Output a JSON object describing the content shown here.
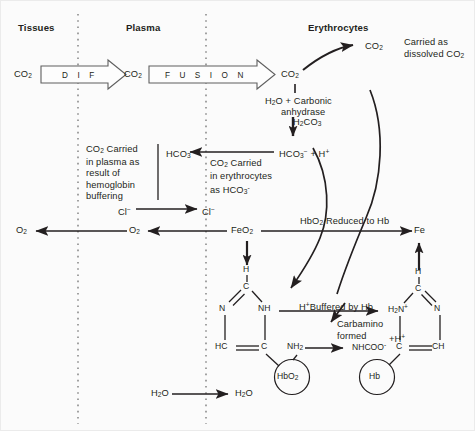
{
  "diagram": {
    "background": "#fbfbfb",
    "ink": "#231f20"
  },
  "columns": {
    "headers": [
      {
        "id": "tissues",
        "label": "Tissues"
      },
      {
        "id": "plasma",
        "label": "Plasma"
      },
      {
        "id": "erythrocytes",
        "label": "Erythrocytes"
      }
    ],
    "divider_style": "dotted-vertical"
  },
  "diffusion_arrows": [
    {
      "id": "dif",
      "text": "D I F"
    },
    {
      "id": "fusion",
      "text": "F U S I O N"
    }
  ],
  "species": {
    "co2_tissue": {
      "main": "CO",
      "sub": "2"
    },
    "co2_plasma": {
      "main": "CO",
      "sub": "2"
    },
    "co2_rbc": {
      "main": "CO",
      "sub": "2"
    },
    "co2_dissolved": {
      "main": "CO",
      "sub": "2"
    },
    "h2co3": {
      "main": "H",
      "sub": "2",
      "main2": "CO",
      "sub2": "3"
    },
    "hco3_h": {
      "text": "HCO3- + H+"
    },
    "hco3_plasma": {
      "text": "HCO3-"
    },
    "cl_plasma": {
      "text": "Cl-"
    },
    "cl_rbc": {
      "text": "Cl-"
    },
    "o2_tissue": {
      "main": "O",
      "sub": "2"
    },
    "o2_plasma": {
      "main": "O",
      "sub": "2"
    },
    "feo2": {
      "main": "FeO",
      "sub": "2"
    },
    "fe": {
      "text": "Fe"
    },
    "h2o_plasma": {
      "main": "H",
      "sub": "2",
      "main2": "O"
    },
    "h2o_rbc": {
      "main": "H",
      "sub": "2",
      "main2": "O"
    }
  },
  "annotations": {
    "carried_dissolved": "Carried as dissolved CO2",
    "carried_dissolved_line1": "Carried as",
    "carried_dissolved_line2_pre": "dissolved CO",
    "carried_dissolved_line2_sub": "2",
    "carbonic_line1_pre": "H",
    "carbonic_line1_sub": "2",
    "carbonic_line1_post": "O + Carbonic",
    "carbonic_line2": "anhydrase",
    "plasma_buffer_line1_pre": "CO",
    "plasma_buffer_line1_sub": "2",
    "plasma_buffer_line1_post": " Carried",
    "plasma_buffer_line2": "in plasma as",
    "plasma_buffer_line3": "result of",
    "plasma_buffer_line4": "hemoglobin",
    "plasma_buffer_line5": "buffering",
    "rbc_bicarb_line1_pre": "CO",
    "rbc_bicarb_line1_sub": "2",
    "rbc_bicarb_line1_post": " Carried",
    "rbc_bicarb_line2": "in erythrocytes",
    "rbc_bicarb_line3_pre": "as HCO",
    "rbc_bicarb_line3_sub": "3",
    "rbc_bicarb_line3_sup": "-",
    "hbo2_reduced": "HbO2 Reduced to Hb",
    "hbo2_reduced_pre": "HbO",
    "hbo2_reduced_sub": "2",
    "hbo2_reduced_post": " Reduced to Hb",
    "h_buffered_sup": "+",
    "h_buffered_pre": "H",
    "h_buffered_post": "Buffered by Hb",
    "carbamino_line1": "Carbamino",
    "carbamino_line2": "formed",
    "carbamino_plus_h": "+H+"
  },
  "imidazole_left": {
    "name": "histidine-imidazole-oxygenated",
    "top_h": "H",
    "top_c": "C",
    "left_n": "N",
    "right_nh": "NH",
    "bottom_left": "HC",
    "bottom_right": "C",
    "side_group": "NH2",
    "side_group_pre": "NH",
    "side_group_sub": "2",
    "circle_label": "HbO2",
    "circle_label_pre": "HbO",
    "circle_label_sub": "2"
  },
  "imidazole_right": {
    "name": "histidine-imidazole-deoxygenated",
    "top_h": "H",
    "top_c": "C",
    "left_nh2": "H2N+",
    "left_nh2_pre": "H",
    "left_nh2_sub": "2",
    "left_nh2_post": "N",
    "left_nh2_sup": "+",
    "right_n": "N",
    "bottom_left": "C",
    "bottom_right": "CH",
    "side_group": "NHCOO-",
    "side_group_pre": "NHCOO",
    "side_group_sup": "-",
    "circle_label": "Hb"
  }
}
